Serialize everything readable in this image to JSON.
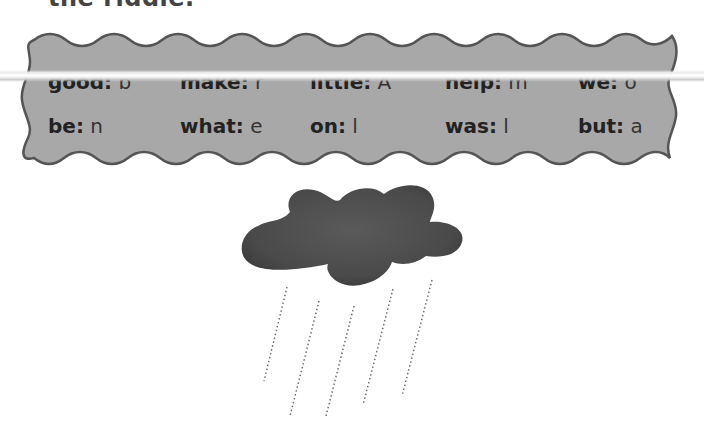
{
  "title": {
    "text": "the riddle."
  },
  "banner": {
    "fill": "#a8a8a8",
    "stroke": "#555555",
    "rows": [
      [
        {
          "word": "good:",
          "letter": "b"
        },
        {
          "word": "make:",
          "letter": "r"
        },
        {
          "word": "little:",
          "letter": "A"
        },
        {
          "word": "help:",
          "letter": "m"
        },
        {
          "word": "we:",
          "letter": "o"
        }
      ],
      [
        {
          "word": "be:",
          "letter": "n"
        },
        {
          "word": "what:",
          "letter": "e"
        },
        {
          "word": "on:",
          "letter": "l"
        },
        {
          "word": "was:",
          "letter": "l"
        },
        {
          "word": "but:",
          "letter": "a"
        }
      ]
    ]
  },
  "illustration": {
    "cloud_icon": "rain-cloud-icon",
    "cloud_color": "#4a4a4a",
    "rain_lines": 5
  }
}
